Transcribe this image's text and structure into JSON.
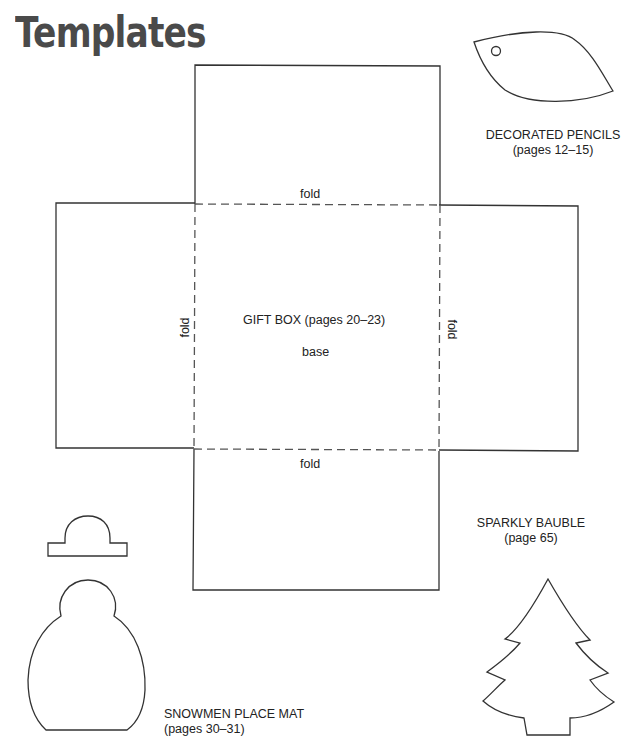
{
  "page": {
    "title": "Templates"
  },
  "gift_box": {
    "label": "GIFT BOX (pages 20–23)",
    "base_label": "base",
    "fold_top": "fold",
    "fold_bottom": "fold",
    "fold_left": "fold",
    "fold_right": "fold"
  },
  "decorated_pencils": {
    "name": "DECORATED PENCILS",
    "pages": "(pages 12–15)"
  },
  "sparkly_bauble": {
    "name": "SPARKLY BAUBLE",
    "pages": "(page 65)"
  },
  "snowmen_place_mat": {
    "name": "SNOWMEN PLACE MAT",
    "pages": "(pages 30–31)"
  },
  "colors": {
    "line": "#333333",
    "title": "#4a4a4a",
    "background": "#ffffff"
  }
}
